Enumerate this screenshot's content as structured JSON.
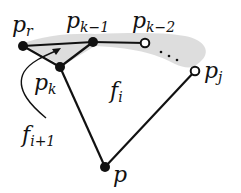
{
  "diagram": {
    "colors": {
      "ink": "#111111",
      "shade": "#d9d9d9",
      "background": "#ffffff"
    },
    "labels": {
      "p_r": {
        "main": "p",
        "sub": "r"
      },
      "p_k_minus_1": {
        "main": "p",
        "sub": "k−1"
      },
      "p_k_minus_2": {
        "main": "p",
        "sub": "k−2"
      },
      "p_k": {
        "main": "p",
        "sub": "k"
      },
      "p_j": {
        "main": "p",
        "sub": "j"
      },
      "p": {
        "main": "p"
      },
      "f_i": {
        "main": "f",
        "sub": "i"
      },
      "f_i_plus_1": {
        "main": "f",
        "sub": "i+1"
      }
    },
    "nodes": [
      {
        "id": "p_r",
        "filled": true
      },
      {
        "id": "p_k_minus_1",
        "filled": true
      },
      {
        "id": "p_k_minus_2",
        "filled": false
      },
      {
        "id": "p_k",
        "filled": true
      },
      {
        "id": "p_j",
        "filled": false
      },
      {
        "id": "p",
        "filled": true
      }
    ],
    "edges": [
      [
        "p_r",
        "p_k_minus_1"
      ],
      [
        "p_k_minus_1",
        "p_k_minus_2"
      ],
      [
        "p_r",
        "p_k"
      ],
      [
        "p_k",
        "p_k_minus_1"
      ],
      [
        "p_k",
        "p"
      ],
      [
        "p",
        "p_j"
      ]
    ],
    "dotted_chain": [
      "p_k_minus_2",
      "p_j"
    ],
    "ellipsis": "· · ·"
  }
}
